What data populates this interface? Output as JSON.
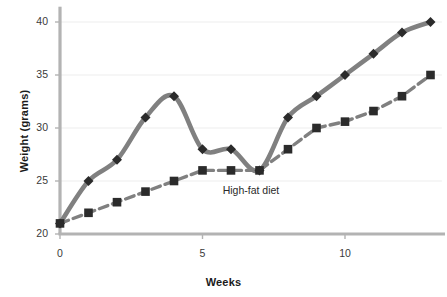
{
  "chart_data": {
    "type": "line",
    "title": "",
    "subtitle": "",
    "xlabel": "Weeks",
    "ylabel": "Weight (grams)",
    "x": [
      0,
      1,
      2,
      3,
      4,
      5,
      6,
      7,
      8,
      9,
      10,
      11,
      12,
      13
    ],
    "xlim": [
      0,
      13.4
    ],
    "ylim": [
      20,
      40.5
    ],
    "xticks": [
      0,
      5,
      10
    ],
    "xticklabels": [
      "0",
      "5",
      "10"
    ],
    "yticks": [
      20,
      25,
      30,
      35,
      40
    ],
    "yticklabels": [
      "20",
      "25",
      "30",
      "35",
      "40"
    ],
    "grid": "horizontal-faint",
    "legend": "none",
    "annotations": [
      {
        "text": "High-fat diet",
        "x": 6.9,
        "y": 24.1
      }
    ],
    "series": [
      {
        "name": "high-fat-diet-group",
        "marker": "diamond",
        "linestyle": "solid",
        "line_color": "#808080",
        "marker_color": "#2b2b2b",
        "values": [
          21,
          25,
          27,
          31,
          33,
          28,
          28,
          26,
          31,
          33,
          35,
          37,
          39,
          40
        ]
      },
      {
        "name": "control-group",
        "marker": "square",
        "linestyle": "dashed",
        "line_color": "#808080",
        "marker_color": "#2b2b2b",
        "values": [
          21,
          22,
          23,
          24,
          25,
          26,
          26,
          26,
          28,
          30,
          30.6,
          31.6,
          33,
          35
        ]
      }
    ]
  },
  "axis": {
    "x_title": "Weeks",
    "y_title": "Weight (grams)"
  },
  "colors": {
    "line": "#808080",
    "marker": "#2b2b2b",
    "axis": "#b3b3b3",
    "grid": "#ededed",
    "text": "#1b1b1b",
    "background": "#ffffff"
  }
}
